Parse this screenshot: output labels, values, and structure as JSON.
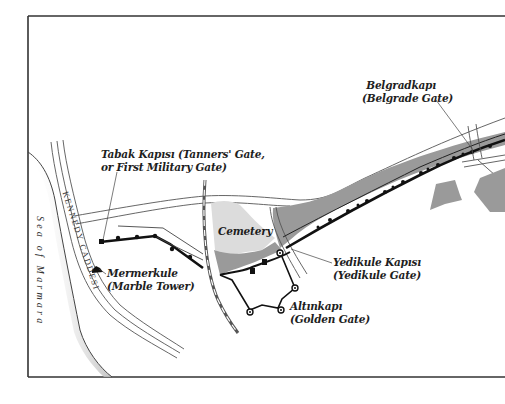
{
  "map": {
    "frame": {
      "left": 28,
      "top": 16,
      "bottom": 377
    },
    "colors": {
      "frame": "#333333",
      "wall": "#111111",
      "road": "#555555",
      "moat_fill": "#9a9a9a",
      "cemetery_fill": "#dcdcdc",
      "block_fill": "#9a9a9a",
      "sea_shadow": "#cfcfcf",
      "railway": "#666666"
    },
    "water": {
      "label": "Sea of Marmara"
    },
    "streets": [
      {
        "name": "KENNEDY CADDESI"
      }
    ],
    "areas": [
      {
        "name": "cemetery",
        "label": "Cemetery"
      }
    ],
    "landmarks": [
      {
        "id": "tabak-kapisi",
        "name": "Tabak Kapısı (Tanners' Gate,",
        "subtitle": "or First Military Gate)"
      },
      {
        "id": "mermerkule",
        "name": "Mermerkule",
        "subtitle": "(Marble Tower)"
      },
      {
        "id": "belgradkapi",
        "name": "Belgradkapı",
        "subtitle": "(Belgrade Gate)"
      },
      {
        "id": "yedikule-kapisi",
        "name": "Yedikule Kapısı",
        "subtitle": "(Yedikule Gate)"
      },
      {
        "id": "altinkapi",
        "name": "Altınkapı",
        "subtitle": "(Golden Gate)"
      }
    ]
  }
}
